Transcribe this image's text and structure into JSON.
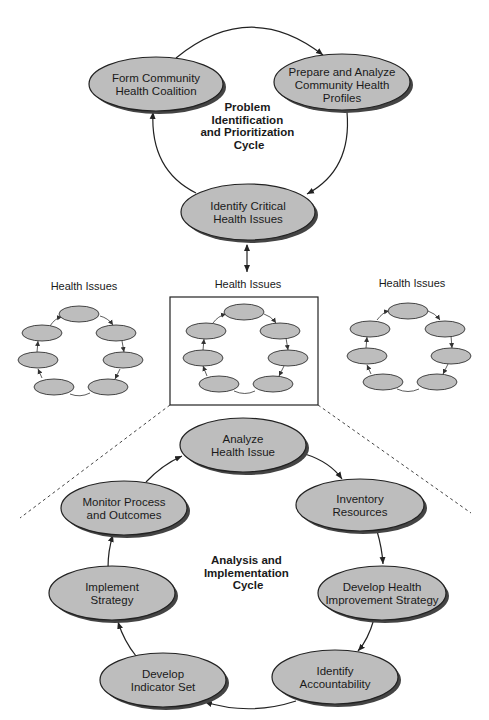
{
  "top_cycle": {
    "title_lines": [
      "Problem",
      "Identification",
      "and Prioritization",
      "Cycle"
    ],
    "nodes": [
      {
        "id": "form-coalition",
        "lines": [
          "Form Community",
          "Health Coalition"
        ]
      },
      {
        "id": "prepare-profiles",
        "lines": [
          "Prepare and Analyze",
          "Community Health",
          "Profiles"
        ]
      },
      {
        "id": "identify-critical",
        "lines": [
          "Identify Critical",
          "Health Issues"
        ]
      }
    ]
  },
  "health_issues": {
    "groups": [
      {
        "label": "Health Issues"
      },
      {
        "label": "Health Issues"
      },
      {
        "label": "Health Issues"
      }
    ],
    "nodes_per_group": 6
  },
  "bottom_cycle": {
    "title_lines": [
      "Analysis and",
      "Implementation",
      "Cycle"
    ],
    "nodes": [
      {
        "id": "analyze-issue",
        "lines": [
          "Analyze",
          "Health Issue"
        ]
      },
      {
        "id": "inventory-resources",
        "lines": [
          "Inventory",
          "Resources"
        ]
      },
      {
        "id": "develop-strategy",
        "lines": [
          "Develop Health",
          "Improvement Strategy"
        ]
      },
      {
        "id": "identify-accountability",
        "lines": [
          "Identify",
          "Accountability"
        ]
      },
      {
        "id": "develop-indicators",
        "lines": [
          "Develop",
          "Indicator Set"
        ]
      },
      {
        "id": "implement-strategy",
        "lines": [
          "Implement",
          "Strategy"
        ]
      },
      {
        "id": "monitor-process",
        "lines": [
          "Monitor Process",
          "and Outcomes"
        ]
      }
    ]
  },
  "colors": {
    "node_fill": "#bdbdbd",
    "stroke": "#222222",
    "background": "#ffffff"
  }
}
